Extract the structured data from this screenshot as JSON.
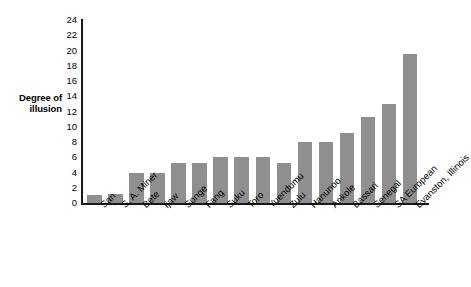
{
  "chart_data": {
    "type": "bar",
    "title": "",
    "subtitle": "",
    "xlabel": "",
    "ylabel": "Degree of illusion",
    "ylabel_lines": [
      "Degree of",
      "illusion"
    ],
    "ylim": [
      0,
      24
    ],
    "ytick_step": 2,
    "yticks": [
      24,
      22,
      20,
      18,
      16,
      14,
      12,
      10,
      8,
      6,
      4,
      2,
      0
    ],
    "grid": false,
    "legend": false,
    "legend_position": "none",
    "bar_color": "#8f8f8f",
    "axis_color": "#1a1a1a",
    "background": "#ffffff",
    "xtick_rotation_deg": -45,
    "categories": [
      "San",
      "S. A. Miner",
      "Bete",
      "Ijaw",
      "Songe",
      "Fang",
      "Suku",
      "Toro",
      "Yuendumu",
      "Zulu",
      "Hanunoo",
      "Ankole",
      "Bassari",
      "Senegal",
      "SA European",
      "Evanston, Illinois"
    ],
    "values": [
      1,
      1.2,
      4,
      4,
      5.2,
      5.2,
      6,
      6,
      6,
      5.2,
      8,
      8,
      9.2,
      11.3,
      13,
      19.5
    ]
  }
}
